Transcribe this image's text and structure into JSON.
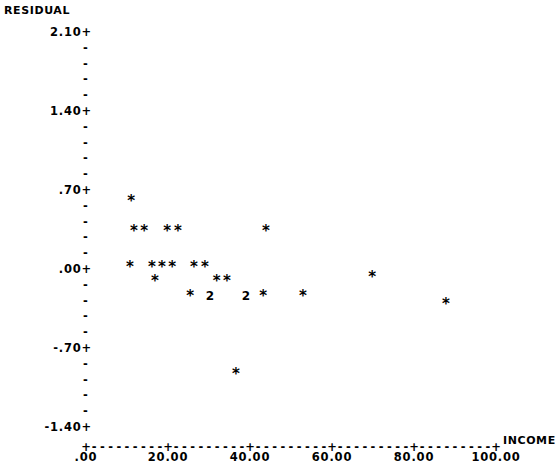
{
  "chart_data": {
    "type": "scatter",
    "title": "",
    "subtitle": "",
    "ylabel": "RESIDUAL",
    "xlabel": "INCOME",
    "ylim": [
      -1.4,
      2.1
    ],
    "xlim": [
      0.0,
      100.0
    ],
    "grid": false,
    "legend": null,
    "y_tick_labels": [
      "2.10+",
      "1.40+",
      ".70+",
      ".00+",
      "-.70+",
      "-1.40+"
    ],
    "y_tick_values": [
      2.1,
      1.4,
      0.7,
      0.0,
      -0.7,
      -1.4
    ],
    "y_minor_tick_glyph": "-",
    "y_minor_ticks_between": 4,
    "x_tick_labels": [
      ".00",
      "20.00",
      "40.00",
      "60.00",
      "80.00",
      "100.00"
    ],
    "x_tick_values": [
      0,
      20,
      40,
      60,
      80,
      100
    ],
    "x_axis_glyph_major": "+",
    "x_axis_glyph_minor": "-",
    "point_glyph": "*",
    "overlap_glyph_note": "numeric digit indicates count of coincident points",
    "points": [
      {
        "x": 11.0,
        "y": 0.6,
        "n": 1,
        "glyph": "*"
      },
      {
        "x": 11.7,
        "y": 0.34,
        "n": 1,
        "glyph": "*"
      },
      {
        "x": 14.2,
        "y": 0.34,
        "n": 1,
        "glyph": "*"
      },
      {
        "x": 19.8,
        "y": 0.34,
        "n": 1,
        "glyph": "*"
      },
      {
        "x": 22.4,
        "y": 0.34,
        "n": 1,
        "glyph": "*"
      },
      {
        "x": 43.9,
        "y": 0.34,
        "n": 1,
        "glyph": "*"
      },
      {
        "x": 10.7,
        "y": 0.02,
        "n": 1,
        "glyph": "*"
      },
      {
        "x": 16.1,
        "y": 0.02,
        "n": 1,
        "glyph": "*"
      },
      {
        "x": 18.5,
        "y": 0.02,
        "n": 1,
        "glyph": "*"
      },
      {
        "x": 21.0,
        "y": 0.02,
        "n": 1,
        "glyph": "*"
      },
      {
        "x": 26.3,
        "y": 0.02,
        "n": 1,
        "glyph": "*"
      },
      {
        "x": 29.0,
        "y": 0.02,
        "n": 1,
        "glyph": "*"
      },
      {
        "x": 16.8,
        "y": -0.11,
        "n": 1,
        "glyph": "*"
      },
      {
        "x": 31.9,
        "y": -0.11,
        "n": 1,
        "glyph": "*"
      },
      {
        "x": 34.4,
        "y": -0.11,
        "n": 1,
        "glyph": "*"
      },
      {
        "x": 25.4,
        "y": -0.24,
        "n": 1,
        "glyph": "*"
      },
      {
        "x": 30.2,
        "y": -0.24,
        "n": 2,
        "glyph": "2"
      },
      {
        "x": 39.0,
        "y": -0.24,
        "n": 2,
        "glyph": "2"
      },
      {
        "x": 43.2,
        "y": -0.24,
        "n": 1,
        "glyph": "*"
      },
      {
        "x": 52.9,
        "y": -0.24,
        "n": 1,
        "glyph": "*"
      },
      {
        "x": 69.8,
        "y": -0.07,
        "n": 1,
        "glyph": "*"
      },
      {
        "x": 87.8,
        "y": -0.31,
        "n": 1,
        "glyph": "*"
      },
      {
        "x": 36.6,
        "y": -0.93,
        "n": 1,
        "glyph": "*"
      }
    ]
  },
  "axes": {
    "y_title": "RESIDUAL",
    "x_title": "INCOME",
    "y_labels": {
      "t0": "2.10+",
      "t1": "1.40+",
      "t2": ".70+",
      "t3": ".00+",
      "t4": "-.70+",
      "t5": "-1.40+"
    },
    "y_minor": "-",
    "x_labels": {
      "x0": ".00",
      "x1": "20.00",
      "x2": "40.00",
      "x3": "60.00",
      "x4": "80.00",
      "x5": "100.00"
    },
    "x_axis_render": "+---------+---------+---------+---------+---------+"
  }
}
